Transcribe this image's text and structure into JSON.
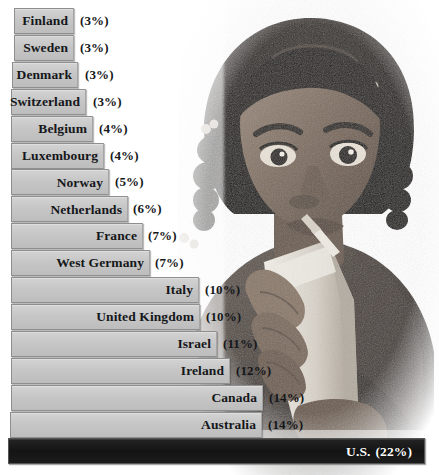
{
  "figure": {
    "kind": "horizontal-bar-chart-with-photo",
    "bar_fill_color": "#c6c6c6",
    "bar_border_color": "#8e8e8e",
    "highlight_bar_color": "#141414",
    "highlight_label_color": "#ffffff",
    "label_color": "#15171a",
    "background_color": "#ffffff"
  },
  "photo": {
    "alt_name": "child-drinking-from-carton-photo",
    "description": "Grayscale photograph of a young child with braided hair drinking from a juice carton with a straw",
    "palette": [
      "#ffffff",
      "#cfcac4",
      "#8a7f76",
      "#4a423c",
      "#1d1815"
    ]
  },
  "chart_data": {
    "type": "bar",
    "orientation": "horizontal",
    "title": "",
    "subtitle": "",
    "xlabel": "",
    "ylabel": "",
    "grid": false,
    "legend": null,
    "xlim": [
      0,
      22
    ],
    "value_suffix": "%",
    "categories": [
      "Finland",
      "Sweden",
      "Denmark",
      "Switzerland",
      "Belgium",
      "Luxembourg",
      "Norway",
      "Netherlands",
      "France",
      "West Germany",
      "Italy",
      "United Kingdom",
      "Israel",
      "Ireland",
      "Canada",
      "Australia",
      "U.S."
    ],
    "values": [
      3,
      3,
      3,
      3,
      4,
      4,
      5,
      6,
      7,
      7,
      10,
      10,
      11,
      12,
      14,
      14,
      22
    ],
    "bars": [
      {
        "label": "Finland",
        "value": 3,
        "value_text": "(3%)",
        "width_px": 60,
        "left_px": 14,
        "highlight": false
      },
      {
        "label": "Sweden",
        "value": 3,
        "value_text": "(3%)",
        "width_px": 60,
        "left_px": 14,
        "highlight": false
      },
      {
        "label": "Denmark",
        "value": 3,
        "value_text": "(3%)",
        "width_px": 66,
        "left_px": 12,
        "highlight": false
      },
      {
        "label": "Switzerland",
        "value": 3,
        "value_text": "(3%)",
        "width_px": 75,
        "left_px": 11,
        "highlight": false
      },
      {
        "label": "Belgium",
        "value": 4,
        "value_text": "(4%)",
        "width_px": 82,
        "left_px": 11,
        "highlight": false
      },
      {
        "label": "Luxembourg",
        "value": 4,
        "value_text": "(4%)",
        "width_px": 93,
        "left_px": 11,
        "highlight": false
      },
      {
        "label": "Norway",
        "value": 5,
        "value_text": "(5%)",
        "width_px": 98,
        "left_px": 11,
        "highlight": false
      },
      {
        "label": "Netherlands",
        "value": 6,
        "value_text": "(6%)",
        "width_px": 117,
        "left_px": 11,
        "highlight": false
      },
      {
        "label": "France",
        "value": 7,
        "value_text": "(7%)",
        "width_px": 132,
        "left_px": 11,
        "highlight": false
      },
      {
        "label": "West Germany",
        "value": 7,
        "value_text": "(7%)",
        "width_px": 139,
        "left_px": 11,
        "highlight": false
      },
      {
        "label": "Italy",
        "value": 10,
        "value_text": "(10%)",
        "width_px": 188,
        "left_px": 11,
        "highlight": false
      },
      {
        "label": "United Kingdom",
        "value": 10,
        "value_text": "(10%)",
        "width_px": 189,
        "left_px": 11,
        "highlight": false
      },
      {
        "label": "Israel",
        "value": 11,
        "value_text": "(11%)",
        "width_px": 206,
        "left_px": 11,
        "highlight": false
      },
      {
        "label": "Ireland",
        "value": 12,
        "value_text": "(12%)",
        "width_px": 219,
        "left_px": 11,
        "highlight": false
      },
      {
        "label": "Canada",
        "value": 14,
        "value_text": "(14%)",
        "width_px": 252,
        "left_px": 11,
        "highlight": false
      },
      {
        "label": "Australia",
        "value": 14,
        "value_text": "(14%)",
        "width_px": 252,
        "left_px": 10,
        "highlight": false
      },
      {
        "label": "U.S.",
        "value": 22,
        "value_text": "(22%)",
        "width_px": 417,
        "left_px": 8,
        "highlight": true
      }
    ]
  }
}
